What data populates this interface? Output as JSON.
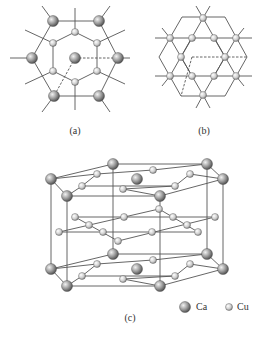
{
  "figure": {
    "panels": [
      {
        "id": "a",
        "label": "(a)",
        "label_pos": [
          75,
          125
        ]
      },
      {
        "id": "b",
        "label": "(b)",
        "label_pos": [
          204,
          125
        ]
      },
      {
        "id": "c",
        "label": "(c)",
        "label_pos": [
          130,
          312
        ]
      }
    ],
    "legend": [
      {
        "element": "Ca",
        "label": "Ca",
        "ball": [
          185,
          307
        ],
        "r": 5.5,
        "text_pos": [
          196,
          301
        ]
      },
      {
        "element": "Cu",
        "label": "Cu",
        "ball": [
          229,
          307
        ],
        "r": 3.5,
        "text_pos": [
          237,
          301
        ]
      }
    ],
    "colors": {
      "line": "#555555",
      "ca_light": "#f2f2f2",
      "ca_dark": "#4a4a4a",
      "cu_light": "#f5f5f5",
      "cu_dark": "#8a8a8a",
      "stroke": "#444444"
    }
  },
  "panel_a": {
    "ca": [
      [
        53,
        21
      ],
      [
        99,
        21
      ],
      [
        32,
        58
      ],
      [
        118,
        58
      ],
      [
        75,
        58
      ],
      [
        54,
        96
      ],
      [
        99,
        96
      ]
    ],
    "cu": [
      [
        75,
        32
      ],
      [
        53,
        43
      ],
      [
        97,
        43
      ],
      [
        53,
        71
      ],
      [
        97,
        71
      ],
      [
        75,
        82
      ]
    ],
    "lines": [
      [
        53,
        21,
        99,
        21
      ],
      [
        54,
        96,
        99,
        96
      ],
      [
        53,
        21,
        32,
        58
      ],
      [
        32,
        58,
        54,
        96
      ],
      [
        99,
        21,
        118,
        58
      ],
      [
        118,
        58,
        99,
        96
      ],
      [
        75,
        32,
        53,
        43
      ],
      [
        75,
        32,
        97,
        43
      ],
      [
        53,
        43,
        53,
        71
      ],
      [
        97,
        43,
        97,
        71
      ],
      [
        53,
        71,
        75,
        82
      ],
      [
        97,
        71,
        75,
        82
      ],
      [
        75,
        8,
        75,
        32
      ],
      [
        75,
        82,
        75,
        110
      ],
      [
        53,
        21,
        42,
        6
      ],
      [
        99,
        21,
        110,
        6
      ],
      [
        54,
        96,
        42,
        112
      ],
      [
        99,
        96,
        110,
        112
      ],
      [
        32,
        58,
        10,
        58
      ],
      [
        118,
        58,
        130,
        58
      ],
      [
        53,
        43,
        25,
        30
      ],
      [
        97,
        43,
        125,
        30
      ],
      [
        53,
        71,
        25,
        84
      ],
      [
        97,
        71,
        125,
        84
      ]
    ],
    "dashed": [
      [
        75,
        58,
        118,
        58
      ],
      [
        75,
        58,
        54,
        96
      ]
    ]
  },
  "panel_b": {
    "cu": [
      [
        203,
        18
      ],
      [
        170,
        38
      ],
      [
        192,
        38
      ],
      [
        214,
        38
      ],
      [
        236,
        38
      ],
      [
        181,
        57
      ],
      [
        225,
        57
      ],
      [
        170,
        76
      ],
      [
        192,
        76
      ],
      [
        214,
        76
      ],
      [
        236,
        76
      ],
      [
        203,
        95
      ]
    ],
    "lines": [
      [
        182,
        17,
        225,
        17
      ],
      [
        225,
        17,
        247,
        57
      ],
      [
        247,
        57,
        225,
        96
      ],
      [
        225,
        96,
        181,
        96
      ],
      [
        181,
        96,
        159,
        57
      ],
      [
        159,
        57,
        182,
        17
      ],
      [
        155,
        38,
        252,
        38
      ],
      [
        155,
        76,
        252,
        76
      ],
      [
        203,
        18,
        170,
        76
      ],
      [
        203,
        18,
        236,
        76
      ],
      [
        170,
        38,
        203,
        95
      ],
      [
        236,
        38,
        203,
        95
      ],
      [
        192,
        38,
        181,
        57
      ],
      [
        214,
        38,
        225,
        57
      ],
      [
        181,
        57,
        192,
        76
      ],
      [
        225,
        57,
        214,
        76
      ],
      [
        203,
        18,
        196,
        6
      ],
      [
        203,
        18,
        210,
        6
      ],
      [
        203,
        95,
        196,
        108
      ],
      [
        203,
        95,
        210,
        108
      ],
      [
        170,
        38,
        162,
        28
      ],
      [
        236,
        38,
        244,
        28
      ],
      [
        170,
        76,
        162,
        86
      ],
      [
        236,
        76,
        244,
        86
      ]
    ],
    "dashed": [
      [
        192,
        57,
        247,
        57
      ],
      [
        192,
        57,
        181,
        96
      ]
    ]
  },
  "panel_c": {
    "layers": [
      {
        "ca": [
          [
            113,
            164
          ],
          [
            207,
            164
          ],
          [
            51,
            179
          ],
          [
            223,
            179
          ],
          [
            137,
            179
          ],
          [
            67,
            196
          ],
          [
            160,
            196
          ]
        ],
        "cu": [
          [
            153,
            170
          ],
          [
            97,
            174
          ],
          [
            190,
            174
          ],
          [
            82,
            186
          ],
          [
            175,
            186
          ],
          [
            123,
            189
          ]
        ],
        "lines": [
          [
            113,
            164,
            207,
            164
          ],
          [
            51,
            179,
            113,
            164
          ],
          [
            207,
            164,
            223,
            179
          ],
          [
            51,
            179,
            67,
            196
          ],
          [
            223,
            179,
            160,
            196
          ],
          [
            67,
            196,
            160,
            196
          ],
          [
            51,
            179,
            97,
            174
          ],
          [
            97,
            174,
            153,
            170
          ],
          [
            153,
            170,
            207,
            164
          ],
          [
            82,
            186,
            97,
            174
          ],
          [
            82,
            186,
            175,
            186
          ],
          [
            175,
            186,
            190,
            174
          ],
          [
            190,
            174,
            223,
            179
          ],
          [
            123,
            189,
            160,
            196
          ],
          [
            67,
            196,
            82,
            186
          ],
          [
            123,
            189,
            175,
            186
          ]
        ]
      },
      {
        "ca": [
          [
            113,
            254
          ],
          [
            207,
            254
          ],
          [
            51,
            269
          ],
          [
            223,
            269
          ],
          [
            137,
            269
          ],
          [
            67,
            286
          ],
          [
            160,
            286
          ]
        ],
        "cu": [
          [
            153,
            260
          ],
          [
            97,
            264
          ],
          [
            190,
            264
          ],
          [
            82,
            276
          ],
          [
            175,
            276
          ],
          [
            123,
            279
          ]
        ],
        "lines": [
          [
            113,
            254,
            207,
            254
          ],
          [
            51,
            269,
            113,
            254
          ],
          [
            207,
            254,
            223,
            269
          ],
          [
            51,
            269,
            67,
            286
          ],
          [
            223,
            269,
            160,
            286
          ],
          [
            67,
            286,
            160,
            286
          ],
          [
            51,
            269,
            97,
            264
          ],
          [
            97,
            264,
            153,
            260
          ],
          [
            153,
            260,
            207,
            254
          ],
          [
            82,
            276,
            97,
            264
          ],
          [
            82,
            276,
            175,
            276
          ],
          [
            175,
            276,
            190,
            264
          ],
          [
            190,
            264,
            223,
            269
          ],
          [
            123,
            279,
            160,
            286
          ],
          [
            67,
            286,
            82,
            276
          ],
          [
            123,
            279,
            175,
            276
          ]
        ]
      }
    ],
    "middle_cu": [
      [
        75,
        217
      ],
      [
        124,
        217
      ],
      [
        159,
        209
      ],
      [
        173,
        217
      ],
      [
        215,
        217
      ],
      [
        59,
        232
      ],
      [
        89,
        225
      ],
      [
        103,
        232
      ],
      [
        152,
        232
      ],
      [
        187,
        225
      ],
      [
        198,
        232
      ],
      [
        118,
        241
      ]
    ],
    "middle_lines": [
      [
        75,
        217,
        215,
        217
      ],
      [
        59,
        232,
        198,
        232
      ],
      [
        59,
        232,
        159,
        209
      ],
      [
        118,
        241,
        215,
        217
      ],
      [
        75,
        217,
        118,
        241
      ],
      [
        159,
        209,
        198,
        232
      ]
    ],
    "verticals": [
      [
        51,
        179,
        51,
        269
      ],
      [
        67,
        196,
        67,
        286
      ],
      [
        113,
        164,
        113,
        254
      ],
      [
        160,
        196,
        160,
        286
      ],
      [
        207,
        164,
        207,
        254
      ],
      [
        223,
        179,
        223,
        269
      ]
    ]
  }
}
